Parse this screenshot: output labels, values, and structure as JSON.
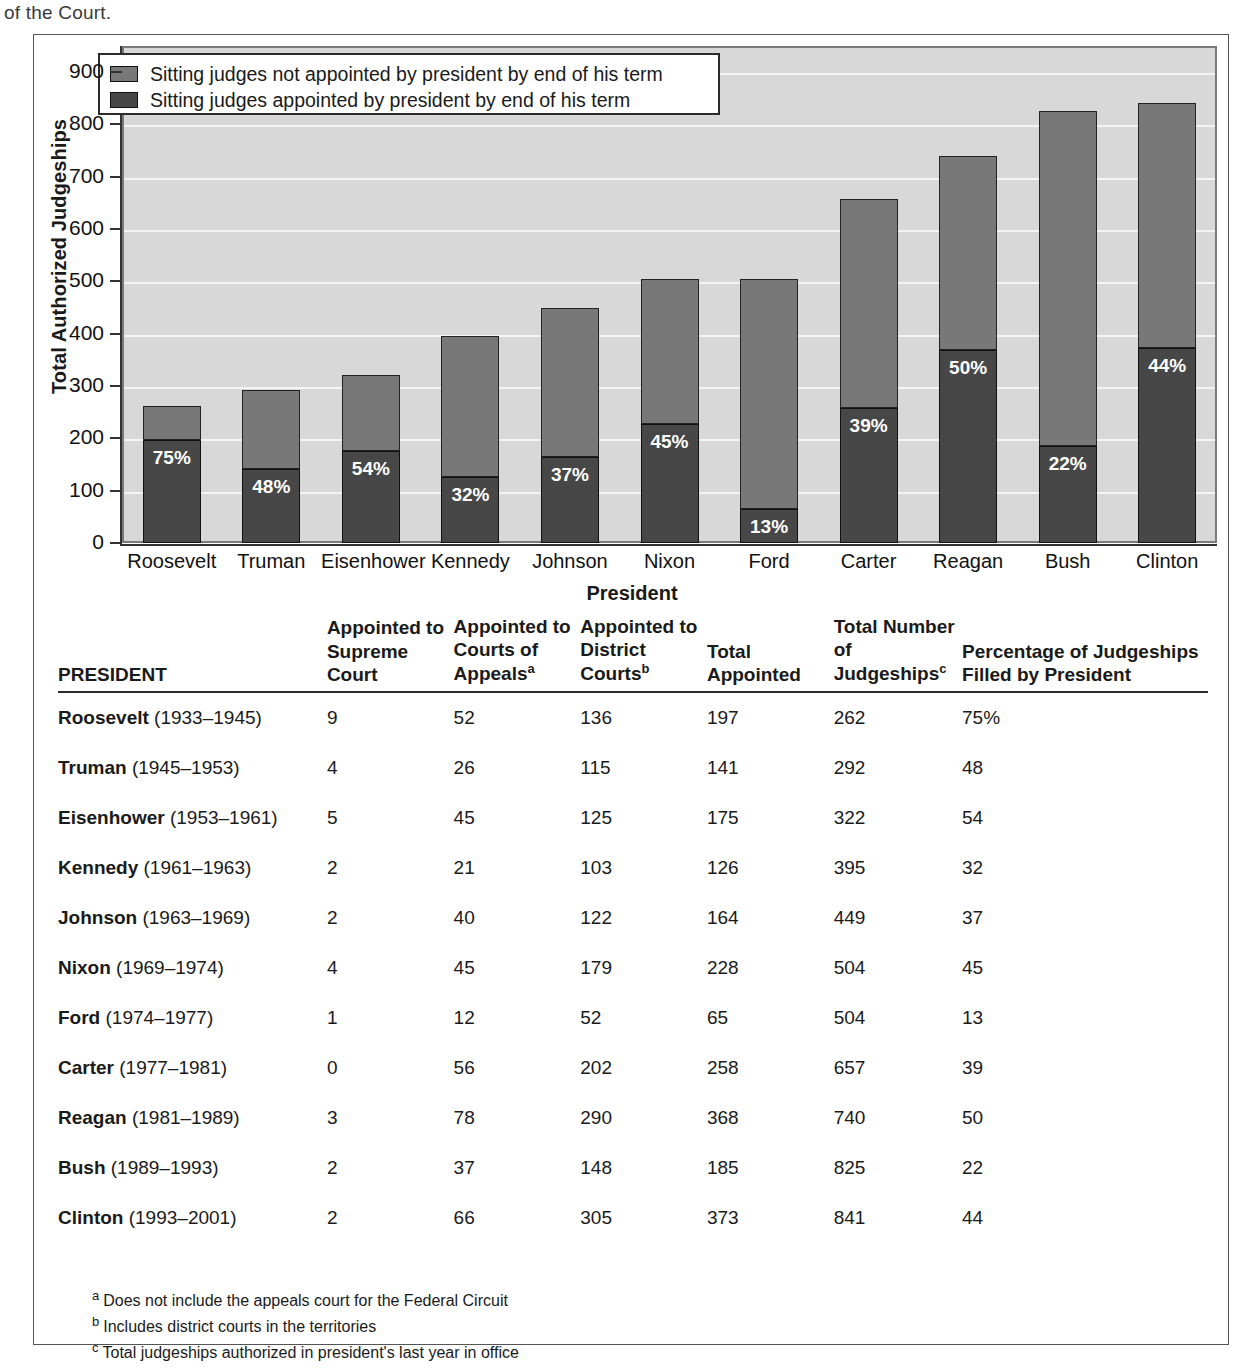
{
  "running_text": "of the Court.",
  "chart_data": {
    "type": "bar",
    "subtype": "stacked",
    "title": "",
    "xlabel": "President",
    "ylabel": "Total Authorized Judgeships",
    "ylim": [
      0,
      950
    ],
    "yticks": [
      0,
      100,
      200,
      300,
      400,
      500,
      600,
      700,
      800,
      900
    ],
    "ytick_labels": [
      "0",
      "100",
      "200",
      "300",
      "400",
      "500",
      "600",
      "700",
      "800",
      "900"
    ],
    "grid": true,
    "legend_position": "top-left",
    "categories": [
      "Roosevelt",
      "Truman",
      "Eisenhower",
      "Kennedy",
      "Johnson",
      "Nixon",
      "Ford",
      "Carter",
      "Reagan",
      "Bush",
      "Clinton"
    ],
    "series": [
      {
        "name": "Sitting judges appointed by president by end of his term",
        "color": "#474747",
        "values": [
          197,
          141,
          175,
          126,
          164,
          228,
          65,
          258,
          368,
          185,
          373
        ]
      },
      {
        "name": "Sitting judges not appointed by president by end of his term",
        "color": "#787878",
        "values": [
          65,
          151,
          147,
          269,
          285,
          276,
          439,
          399,
          372,
          640,
          468
        ]
      }
    ],
    "totals": [
      262,
      292,
      322,
      395,
      449,
      504,
      504,
      657,
      740,
      825,
      841
    ],
    "data_labels": [
      "75%",
      "48%",
      "54%",
      "32%",
      "37%",
      "45%",
      "13%",
      "39%",
      "50%",
      "22%",
      "44%"
    ],
    "plot_background": "#d8d8d8",
    "gridline_color": "#f4f4f4"
  },
  "legend": {
    "items": [
      {
        "label": "Sitting judges not appointed by president by end of his term",
        "color": "#787878"
      },
      {
        "label": "Sitting judges appointed by president by end of his term",
        "color": "#474747"
      }
    ]
  },
  "table": {
    "headers": {
      "president": "PRESIDENT",
      "supreme": "Appointed to Supreme Court",
      "appeals": "Appointed to Courts of Appeals",
      "appeals_sup": "a",
      "district": "Appointed to District Courts",
      "district_sup": "b",
      "total_appointed": "Total Appointed",
      "total_judgeships": "Total Number of Judgeships",
      "total_judgeships_sup": "c",
      "percentage": "Percentage of Judgeships Filled by President"
    },
    "rows": [
      {
        "name": "Roosevelt",
        "years": "(1933–1945)",
        "supreme": "9",
        "appeals": "52",
        "district": "136",
        "total_appointed": "197",
        "total_judgeships": "262",
        "percentage": "75%"
      },
      {
        "name": "Truman",
        "years": "(1945–1953)",
        "supreme": "4",
        "appeals": "26",
        "district": "115",
        "total_appointed": "141",
        "total_judgeships": "292",
        "percentage": "48"
      },
      {
        "name": "Eisenhower",
        "years": "(1953–1961)",
        "supreme": "5",
        "appeals": "45",
        "district": "125",
        "total_appointed": "175",
        "total_judgeships": "322",
        "percentage": "54"
      },
      {
        "name": "Kennedy",
        "years": "(1961–1963)",
        "supreme": "2",
        "appeals": "21",
        "district": "103",
        "total_appointed": "126",
        "total_judgeships": "395",
        "percentage": "32"
      },
      {
        "name": "Johnson",
        "years": "(1963–1969)",
        "supreme": "2",
        "appeals": "40",
        "district": "122",
        "total_appointed": "164",
        "total_judgeships": "449",
        "percentage": "37"
      },
      {
        "name": "Nixon",
        "years": "(1969–1974)",
        "supreme": "4",
        "appeals": "45",
        "district": "179",
        "total_appointed": "228",
        "total_judgeships": "504",
        "percentage": "45"
      },
      {
        "name": "Ford",
        "years": "(1974–1977)",
        "supreme": "1",
        "appeals": "12",
        "district": "52",
        "total_appointed": "65",
        "total_judgeships": "504",
        "percentage": "13"
      },
      {
        "name": "Carter",
        "years": "(1977–1981)",
        "supreme": "0",
        "appeals": "56",
        "district": "202",
        "total_appointed": "258",
        "total_judgeships": "657",
        "percentage": "39"
      },
      {
        "name": "Reagan",
        "years": "(1981–1989)",
        "supreme": "3",
        "appeals": "78",
        "district": "290",
        "total_appointed": "368",
        "total_judgeships": "740",
        "percentage": "50"
      },
      {
        "name": "Bush",
        "years": "(1989–1993)",
        "supreme": "2",
        "appeals": "37",
        "district": "148",
        "total_appointed": "185",
        "total_judgeships": "825",
        "percentage": "22"
      },
      {
        "name": "Clinton",
        "years": "(1993–2001)",
        "supreme": "2",
        "appeals": "66",
        "district": "305",
        "total_appointed": "373",
        "total_judgeships": "841",
        "percentage": "44"
      }
    ]
  },
  "footnotes": [
    {
      "mark": "a",
      "text": "Does not include the appeals court for the Federal Circuit"
    },
    {
      "mark": "b",
      "text": "Includes district courts in the territories"
    },
    {
      "mark": "c",
      "text": "Total judgeships authorized in president's last year in office"
    }
  ]
}
